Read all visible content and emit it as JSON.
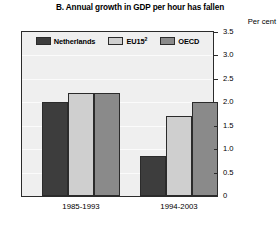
{
  "chart_data": {
    "type": "bar",
    "title": "B. Annual growth in GDP per hour has fallen",
    "unit_label": "Per cent",
    "xlabel": "",
    "ylabel": "Per cent",
    "categories": [
      "1985-1993",
      "1994-2003"
    ],
    "series": [
      {
        "name": "Netherlands",
        "values": [
          2.0,
          0.85
        ],
        "color": "#3d3d3d"
      },
      {
        "name": "EU15",
        "note_marker": "2",
        "values": [
          2.2,
          1.7
        ],
        "color": "#cfcfcf"
      },
      {
        "name": "OECD",
        "values": [
          2.2,
          2.0
        ],
        "color": "#8a8a8a"
      }
    ],
    "ylim": [
      0,
      3.5
    ],
    "ytick_step": 0.5,
    "yticks": [
      "3.5",
      "3.0",
      "2.5",
      "2.0",
      "1.5",
      "1.0",
      "0.5",
      "0"
    ],
    "grid": true,
    "legend_position": "top-inside"
  },
  "legend": [
    {
      "label": "Netherlands",
      "sup": ""
    },
    {
      "label": "EU15",
      "sup": "2"
    },
    {
      "label": "OECD",
      "sup": ""
    }
  ],
  "colors": {
    "netherlands": "#3d3d3d",
    "eu15": "#cfcfcf",
    "oecd": "#8a8a8a",
    "plot_background": "#efefef",
    "frame": "#2b2b2b",
    "page_background": "#ffffff"
  }
}
